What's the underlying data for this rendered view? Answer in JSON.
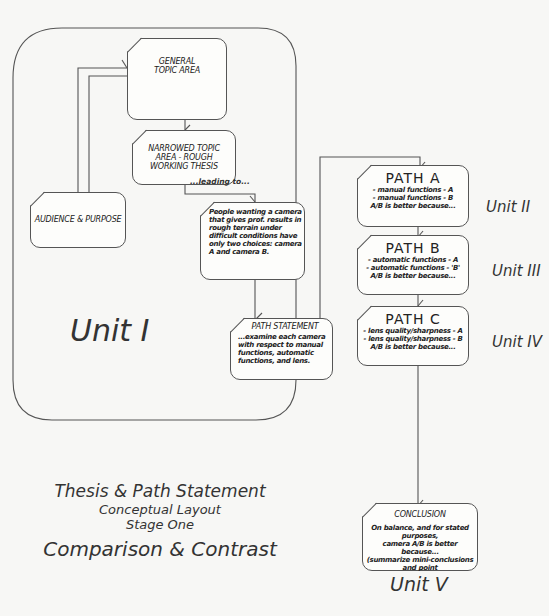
{
  "diagram": {
    "unit_labels": {
      "unit1": "Unit I",
      "unit2": "Unit II",
      "unit3": "Unit III",
      "unit4": "Unit IV",
      "unit5": "Unit V"
    },
    "boxes": {
      "general": {
        "line1": "GENERAL",
        "line2": "TOPIC AREA"
      },
      "narrowed": {
        "line1": "NARROWED TOPIC",
        "line2": "AREA - ROUGH",
        "line3": "WORKING THESIS"
      },
      "audience": {
        "label": "AUDIENCE & PURPOSE"
      },
      "leading": {
        "label": "...leading to..."
      },
      "thesis": {
        "lines": [
          "People wanting a camera",
          "that gives prof. results in",
          "rough terrain under",
          "difficult conditions have",
          "only two choices: camera",
          "A and camera B."
        ]
      },
      "path_statement": {
        "title": "PATH STATEMENT",
        "lines": [
          "...examine each camera",
          "with respect to manual",
          "functions, automatic",
          "functions, and lens."
        ]
      },
      "path_a": {
        "title": "PATH A",
        "lines": [
          "- manual functions - A",
          "- manual functions - B",
          "A/B is better because..."
        ]
      },
      "path_b": {
        "title": "PATH B",
        "lines": [
          "- automatic functions - A",
          "- automatic functions - 'B'",
          "A/B is better because..."
        ]
      },
      "path_c": {
        "title": "PATH C",
        "lines": [
          "- lens quality/sharpness - A",
          "- lens quality/sharpness - B",
          "A/B is better because..."
        ]
      },
      "conclusion": {
        "title": "CONCLUSION",
        "lines": [
          "On balance, and for stated purposes,",
          "camera A/B is better because...",
          "(summarize mini-conclusions and point",
          "to other possible applications)."
        ]
      }
    },
    "caption": {
      "line1": "Thesis & Path Statement",
      "line2": "Conceptual Layout",
      "line3": "Stage One",
      "line4": "Comparison & Contrast"
    }
  }
}
